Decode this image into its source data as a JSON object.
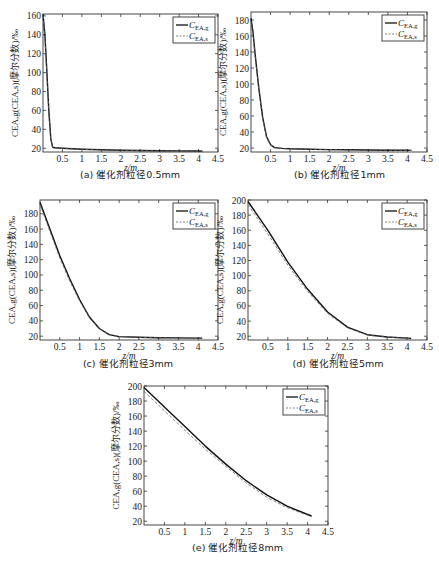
{
  "figure": {
    "y_axis_label": "C_EA,g(C_EA,s)(摩尔分数)/‰",
    "x_axis_label": "z/m",
    "legend": [
      "C_EA,g",
      "C_EA,s"
    ]
  },
  "panels": [
    {
      "id": "a",
      "caption": "(a) 催化剂粒径0.5mm"
    },
    {
      "id": "b",
      "caption": "(b) 催化剂粒径1mm"
    },
    {
      "id": "c",
      "caption": "(c) 催化剂粒径3mm"
    },
    {
      "id": "d",
      "caption": "(d) 催化剂粒径5mm"
    },
    {
      "id": "e",
      "caption": "(e) 催化剂粒径8mm"
    }
  ],
  "chart_data": [
    {
      "type": "line",
      "title": "(a) 催化剂粒径0.5mm",
      "xlabel": "z/m",
      "ylabel": "C_EA,g(C_EA,s)(摩尔分数)/‰",
      "xlim": [
        0,
        4.5
      ],
      "ylim": [
        16,
        162
      ],
      "xticks": [
        0.5,
        1,
        1.5,
        2,
        2.5,
        3,
        3.5,
        4,
        4.5
      ],
      "yticks": [
        20,
        40,
        60,
        80,
        100,
        120,
        140,
        160
      ],
      "legend_position": "upper right",
      "grid": false,
      "series": [
        {
          "name": "C_EA,g",
          "style": "solid",
          "x": [
            0.0,
            0.05,
            0.1,
            0.15,
            0.2,
            0.25,
            0.3,
            0.5,
            1.0,
            1.5,
            2.0,
            2.5,
            3.0,
            3.5,
            4.0,
            4.1
          ],
          "y": [
            162,
            140,
            100,
            60,
            30,
            21,
            20.5,
            20,
            19,
            18.3,
            17.9,
            17.6,
            17.4,
            17.2,
            17.1,
            17
          ]
        },
        {
          "name": "C_EA,s",
          "style": "dashed",
          "x": [
            0.0,
            0.05,
            0.1,
            0.15,
            0.2,
            0.25,
            0.3,
            0.5,
            1.0,
            1.5,
            2.0,
            2.5,
            3.0,
            3.5,
            4.0,
            4.1
          ],
          "y": [
            160,
            138,
            98,
            58,
            29,
            20.7,
            20.3,
            19.8,
            18.9,
            18.2,
            17.8,
            17.5,
            17.3,
            17.1,
            17,
            16.9
          ]
        }
      ]
    },
    {
      "type": "line",
      "title": "(b) 催化剂粒径1mm",
      "xlabel": "z/m",
      "ylabel": "C_EA,g(C_EA,s)(摩尔分数)/‰",
      "xlim": [
        0,
        4.5
      ],
      "ylim": [
        15,
        190
      ],
      "xticks": [
        0.5,
        1,
        1.5,
        2,
        2.5,
        3,
        3.5,
        4,
        4.5
      ],
      "yticks": [
        20,
        40,
        60,
        80,
        100,
        120,
        140,
        160,
        180
      ],
      "legend_position": "upper right",
      "grid": false,
      "series": [
        {
          "name": "C_EA,g",
          "style": "solid",
          "x": [
            0.0,
            0.05,
            0.1,
            0.2,
            0.3,
            0.4,
            0.5,
            0.6,
            0.8,
            1.0,
            1.5,
            2.0,
            2.5,
            3.0,
            3.5,
            4.0,
            4.1
          ],
          "y": [
            182,
            165,
            140,
            95,
            58,
            34,
            24,
            20.5,
            19.5,
            19,
            18.5,
            18,
            17.7,
            17.5,
            17.3,
            17.1,
            17
          ]
        },
        {
          "name": "C_EA,s",
          "style": "dashed",
          "x": [
            0.0,
            0.05,
            0.1,
            0.2,
            0.3,
            0.4,
            0.5,
            0.6,
            0.8,
            1.0,
            1.5,
            2.0,
            2.5,
            3.0,
            3.5,
            4.0,
            4.1
          ],
          "y": [
            178,
            162,
            137,
            93,
            56,
            33,
            23.5,
            20.2,
            19.3,
            18.9,
            18.4,
            17.9,
            17.6,
            17.4,
            17.2,
            17,
            16.9
          ]
        }
      ]
    },
    {
      "type": "line",
      "title": "(c) 催化剂粒径3mm",
      "xlabel": "z/m",
      "ylabel": "C_EA,g(C_EA,s)(摩尔分数)/‰",
      "xlim": [
        0,
        4.5
      ],
      "ylim": [
        15,
        198
      ],
      "xticks": [
        0.5,
        1,
        1.5,
        2,
        2.5,
        3,
        3.5,
        4,
        4.5
      ],
      "yticks": [
        20,
        40,
        60,
        80,
        100,
        120,
        140,
        160,
        180
      ],
      "legend_position": "upper right",
      "grid": false,
      "series": [
        {
          "name": "C_EA,g",
          "style": "solid",
          "x": [
            0.0,
            0.25,
            0.5,
            0.75,
            1.0,
            1.25,
            1.5,
            1.75,
            2.0,
            2.5,
            3.0,
            3.5,
            4.0,
            4.1
          ],
          "y": [
            195,
            160,
            125,
            95,
            68,
            45,
            30,
            22,
            19.5,
            18.5,
            18,
            17.7,
            17.5,
            17.5
          ]
        },
        {
          "name": "C_EA,s",
          "style": "dashed",
          "x": [
            0.0,
            0.25,
            0.5,
            0.75,
            1.0,
            1.25,
            1.5,
            1.75,
            2.0,
            2.5,
            3.0,
            3.5,
            4.0,
            4.1
          ],
          "y": [
            192,
            157,
            122,
            92,
            66,
            44,
            29.5,
            21.8,
            19.3,
            18.4,
            17.9,
            17.6,
            17.4,
            17.4
          ]
        }
      ]
    },
    {
      "type": "line",
      "title": "(d) 催化剂粒径5mm",
      "xlabel": "z/m",
      "ylabel": "C_EA,g(C_EA,s)(摩尔分数)/‰",
      "xlim": [
        0,
        4.5
      ],
      "ylim": [
        15,
        200
      ],
      "xticks": [
        0.5,
        1,
        1.5,
        2,
        2.5,
        3,
        3.5,
        4,
        4.5
      ],
      "yticks": [
        20,
        40,
        60,
        80,
        100,
        120,
        140,
        160,
        180,
        200
      ],
      "legend_position": "upper right",
      "grid": false,
      "series": [
        {
          "name": "C_EA,g",
          "style": "solid",
          "x": [
            0.0,
            0.5,
            1.0,
            1.5,
            2.0,
            2.5,
            3.0,
            3.5,
            4.0,
            4.1
          ],
          "y": [
            198,
            160,
            118,
            82,
            52,
            32,
            22,
            19,
            17.5,
            17
          ]
        },
        {
          "name": "C_EA,s",
          "style": "dashed",
          "x": [
            0.0,
            0.5,
            1.0,
            1.5,
            2.0,
            2.5,
            3.0,
            3.5,
            4.0,
            4.1
          ],
          "y": [
            194,
            155,
            114,
            79,
            50,
            31,
            21.5,
            18.8,
            17.3,
            16.9
          ]
        }
      ]
    },
    {
      "type": "line",
      "title": "(e) 催化剂粒径8mm",
      "xlabel": "z/m",
      "ylabel": "C_EA,g(C_EA,s)(摩尔分数)/‰",
      "xlim": [
        0,
        4.5
      ],
      "ylim": [
        15,
        200
      ],
      "xticks": [
        0.5,
        1,
        1.5,
        2,
        2.5,
        3,
        3.5,
        4,
        4.5
      ],
      "yticks": [
        20,
        40,
        60,
        80,
        100,
        120,
        140,
        160,
        180,
        200
      ],
      "legend_position": "upper right",
      "grid": false,
      "series": [
        {
          "name": "C_EA,g",
          "style": "solid",
          "x": [
            0.0,
            0.5,
            1.0,
            1.5,
            2.0,
            2.5,
            3.0,
            3.5,
            4.0,
            4.1
          ],
          "y": [
            198,
            172,
            146,
            120,
            96,
            74,
            55,
            40,
            29,
            27
          ]
        },
        {
          "name": "C_EA,s",
          "style": "dashed",
          "x": [
            0.0,
            0.5,
            1.0,
            1.5,
            2.0,
            2.5,
            3.0,
            3.5,
            4.0,
            4.1
          ],
          "y": [
            193,
            167,
            141,
            116,
            93,
            71,
            52,
            38,
            28,
            26
          ]
        }
      ]
    }
  ]
}
